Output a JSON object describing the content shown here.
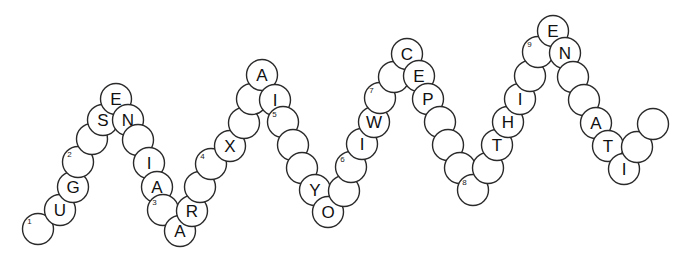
{
  "diagram": {
    "type": "sequence-chain",
    "canvas": {
      "width": 685,
      "height": 259
    },
    "style": {
      "circle_fill": "#ffffff",
      "circle_stroke": "#2a2a2a",
      "label_color": "#111111",
      "index_color": "#222222",
      "background": "#ffffff",
      "circle_radius": 15.5
    },
    "letter_sequence": "UGSENIARXAIYOWICEPTHIENATI",
    "index_markers": [
      "1",
      "2",
      "3",
      "4",
      "5",
      "6",
      "7",
      "8",
      "9"
    ],
    "residues": [
      {
        "id": "r01",
        "label": "",
        "index": "1",
        "cx": 38,
        "cy": 229
      },
      {
        "id": "r02",
        "label": "U",
        "index": "",
        "cx": 60,
        "cy": 210
      },
      {
        "id": "r03",
        "label": "G",
        "index": "",
        "cx": 73,
        "cy": 187
      },
      {
        "id": "r04",
        "label": "",
        "index": "2",
        "cx": 78,
        "cy": 162
      },
      {
        "id": "r05",
        "label": "",
        "index": "",
        "cx": 92,
        "cy": 139
      },
      {
        "id": "r06",
        "label": "S",
        "index": "",
        "cx": 103,
        "cy": 120
      },
      {
        "id": "r07",
        "label": "E",
        "index": "",
        "cx": 116,
        "cy": 99
      },
      {
        "id": "r08",
        "label": "N",
        "index": "",
        "cx": 128,
        "cy": 120
      },
      {
        "id": "r09",
        "label": "",
        "index": "",
        "cx": 138,
        "cy": 140
      },
      {
        "id": "r10",
        "label": "I",
        "index": "",
        "cx": 149,
        "cy": 163
      },
      {
        "id": "r11",
        "label": "A",
        "index": "",
        "cx": 157,
        "cy": 187
      },
      {
        "id": "r12",
        "label": "",
        "index": "3",
        "cx": 163,
        "cy": 210
      },
      {
        "id": "r13",
        "label": "A",
        "index": "",
        "cx": 180,
        "cy": 231
      },
      {
        "id": "r14",
        "label": "R",
        "index": "",
        "cx": 192,
        "cy": 211
      },
      {
        "id": "r15",
        "label": "",
        "index": "",
        "cx": 200,
        "cy": 187
      },
      {
        "id": "r16",
        "label": "",
        "index": "4",
        "cx": 211,
        "cy": 164
      },
      {
        "id": "r17",
        "label": "X",
        "index": "",
        "cx": 230,
        "cy": 146
      },
      {
        "id": "r18",
        "label": "",
        "index": "",
        "cx": 244,
        "cy": 123
      },
      {
        "id": "r19",
        "label": "",
        "index": "",
        "cx": 252,
        "cy": 99
      },
      {
        "id": "r20",
        "label": "A",
        "index": "",
        "cx": 262,
        "cy": 75
      },
      {
        "id": "r21",
        "label": "I",
        "index": "",
        "cx": 275,
        "cy": 100
      },
      {
        "id": "r22",
        "label": "",
        "index": "5",
        "cx": 283,
        "cy": 122
      },
      {
        "id": "r23",
        "label": "",
        "index": "",
        "cx": 293,
        "cy": 145
      },
      {
        "id": "r24",
        "label": "",
        "index": "",
        "cx": 302,
        "cy": 168
      },
      {
        "id": "r25",
        "label": "Y",
        "index": "",
        "cx": 315,
        "cy": 190
      },
      {
        "id": "r26",
        "label": "O",
        "index": "",
        "cx": 328,
        "cy": 212
      },
      {
        "id": "r27",
        "label": "",
        "index": "",
        "cx": 344,
        "cy": 191
      },
      {
        "id": "r28",
        "label": "",
        "index": "6",
        "cx": 351,
        "cy": 167
      },
      {
        "id": "r29",
        "label": "I",
        "index": "",
        "cx": 362,
        "cy": 144
      },
      {
        "id": "r30",
        "label": "W",
        "index": "",
        "cx": 374,
        "cy": 122
      },
      {
        "id": "r31",
        "label": "",
        "index": "7",
        "cx": 380,
        "cy": 98
      },
      {
        "id": "r32",
        "label": "",
        "index": "",
        "cx": 394,
        "cy": 77
      },
      {
        "id": "r33",
        "label": "C",
        "index": "",
        "cx": 407,
        "cy": 54
      },
      {
        "id": "r34",
        "label": "E",
        "index": "",
        "cx": 419,
        "cy": 76
      },
      {
        "id": "r35",
        "label": "P",
        "index": "",
        "cx": 428,
        "cy": 99
      },
      {
        "id": "r36",
        "label": "",
        "index": "",
        "cx": 440,
        "cy": 122
      },
      {
        "id": "r37",
        "label": "",
        "index": "",
        "cx": 448,
        "cy": 145
      },
      {
        "id": "r38",
        "label": "",
        "index": "",
        "cx": 460,
        "cy": 168
      },
      {
        "id": "r39",
        "label": "",
        "index": "8",
        "cx": 473,
        "cy": 190
      },
      {
        "id": "r40",
        "label": "",
        "index": "",
        "cx": 488,
        "cy": 168
      },
      {
        "id": "r41",
        "label": "T",
        "index": "",
        "cx": 497,
        "cy": 145
      },
      {
        "id": "r42",
        "label": "H",
        "index": "",
        "cx": 508,
        "cy": 122
      },
      {
        "id": "r43",
        "label": "I",
        "index": "",
        "cx": 520,
        "cy": 99
      },
      {
        "id": "r44",
        "label": "",
        "index": "",
        "cx": 530,
        "cy": 76
      },
      {
        "id": "r45",
        "label": "",
        "index": "9",
        "cx": 538,
        "cy": 52
      },
      {
        "id": "r46",
        "label": "E",
        "index": "",
        "cx": 553,
        "cy": 31
      },
      {
        "id": "r47",
        "label": "N",
        "index": "",
        "cx": 565,
        "cy": 53
      },
      {
        "id": "r48",
        "label": "",
        "index": "",
        "cx": 573,
        "cy": 77
      },
      {
        "id": "r49",
        "label": "",
        "index": "",
        "cx": 584,
        "cy": 100
      },
      {
        "id": "r50",
        "label": "A",
        "index": "",
        "cx": 596,
        "cy": 123
      },
      {
        "id": "r51",
        "label": "T",
        "index": "",
        "cx": 608,
        "cy": 146
      },
      {
        "id": "r52",
        "label": "I",
        "index": "",
        "cx": 624,
        "cy": 169
      },
      {
        "id": "r53",
        "label": "",
        "index": "",
        "cx": 637,
        "cy": 147
      },
      {
        "id": "r54",
        "label": "",
        "index": "",
        "cx": 653,
        "cy": 124
      }
    ]
  }
}
